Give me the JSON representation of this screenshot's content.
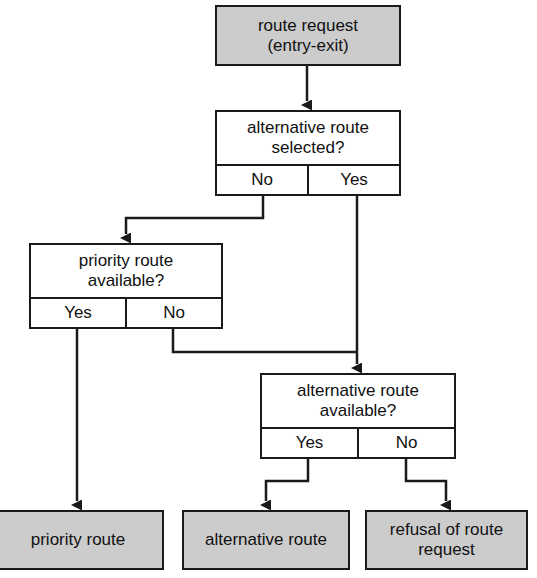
{
  "diagram": {
    "colors": {
      "node_fill_terminal": "#cccccc",
      "node_fill_decision": "#ffffff",
      "stroke": "#1a1a1a",
      "background": "#ffffff",
      "text": "#111111"
    }
  },
  "nodes": {
    "start": {
      "line1": "route request",
      "line2": "(entry-exit)"
    },
    "decision_alt_selected": {
      "line1": "alternative route",
      "line2": "selected?",
      "option_left": "No",
      "option_right": "Yes"
    },
    "decision_priority_available": {
      "line1": "priority route",
      "line2": "available?",
      "option_left": "Yes",
      "option_right": "No"
    },
    "decision_alt_available": {
      "line1": "alternative route",
      "line2": "available?",
      "option_left": "Yes",
      "option_right": "No"
    },
    "end_priority_route": {
      "line1": "priority route"
    },
    "end_alternative_route": {
      "line1": "alternative route"
    },
    "end_refusal": {
      "line1": "refusal of route",
      "line2": "request"
    }
  }
}
